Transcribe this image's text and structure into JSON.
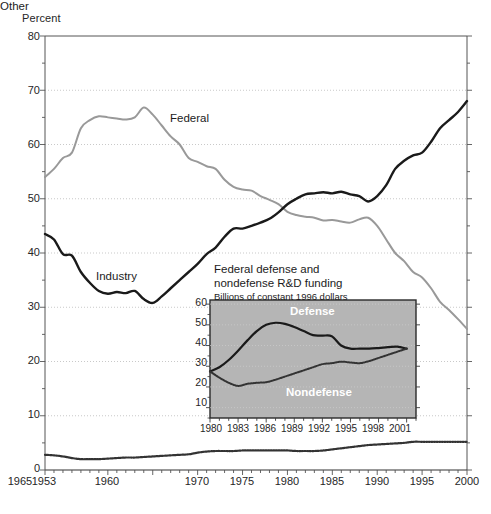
{
  "chart_data": [
    {
      "id": "main",
      "type": "line",
      "title": "",
      "ylabel": "Percent",
      "xlabel": "",
      "xlim": [
        1953,
        2000
      ],
      "ylim": [
        0,
        80
      ],
      "grid": true,
      "legend_position": "inline-annotations",
      "ytick_labels": [
        "80",
        "70",
        "60",
        "50",
        "40",
        "30",
        "20",
        "10",
        "0"
      ],
      "ytick_values": [
        80,
        70,
        60,
        50,
        40,
        30,
        20,
        10,
        0
      ],
      "yminor_step": 5,
      "xtick_labels": [
        "1953",
        "1960",
        "1965",
        "1970",
        "1975",
        "1980",
        "1985",
        "1990",
        "1995",
        "2000"
      ],
      "xtick_values": [
        1953,
        1960,
        1965,
        1970,
        1975,
        1980,
        1985,
        1990,
        1995,
        2000
      ],
      "x": [
        1953,
        1954,
        1955,
        1956,
        1957,
        1958,
        1959,
        1960,
        1961,
        1962,
        1963,
        1964,
        1965,
        1966,
        1967,
        1968,
        1969,
        1970,
        1971,
        1972,
        1973,
        1974,
        1975,
        1976,
        1977,
        1978,
        1979,
        1980,
        1981,
        1982,
        1983,
        1984,
        1985,
        1986,
        1987,
        1988,
        1989,
        1990,
        1991,
        1992,
        1993,
        1994,
        1995,
        1996,
        1997,
        1998,
        1999,
        2000
      ],
      "series": [
        {
          "name": "Federal",
          "color": "#999999",
          "style": "solid",
          "values": [
            54.0,
            55.5,
            57.5,
            58.5,
            63.0,
            64.5,
            65.2,
            65.0,
            64.8,
            64.6,
            65.0,
            66.8,
            65.5,
            63.5,
            61.5,
            60.0,
            57.5,
            56.8,
            56.0,
            55.5,
            53.5,
            52.2,
            51.7,
            51.5,
            50.5,
            49.8,
            49.0,
            47.6,
            47.0,
            46.7,
            46.5,
            46.0,
            46.1,
            45.8,
            45.6,
            46.2,
            46.5,
            45.0,
            42.5,
            40.0,
            38.5,
            36.5,
            35.5,
            33.5,
            31.0,
            29.5,
            27.8,
            26.0
          ]
        },
        {
          "name": "Industry",
          "color": "#1a1a1a",
          "style": "solid",
          "values": [
            43.5,
            42.5,
            39.8,
            39.5,
            36.5,
            34.5,
            33.0,
            32.5,
            32.8,
            32.6,
            33.0,
            31.5,
            30.8,
            32.0,
            33.5,
            35.0,
            36.5,
            38.0,
            39.8,
            41.0,
            43.0,
            44.5,
            44.5,
            45.0,
            45.6,
            46.3,
            47.5,
            49.0,
            50.0,
            50.8,
            51.0,
            51.2,
            51.0,
            51.3,
            50.8,
            50.5,
            49.5,
            50.5,
            52.5,
            55.5,
            57.0,
            58.0,
            58.5,
            60.5,
            63.0,
            64.5,
            66.0,
            68.0
          ]
        },
        {
          "name": "Other",
          "color": "#333333",
          "style": "dotted",
          "values": [
            2.8,
            2.7,
            2.5,
            2.2,
            2.0,
            2.0,
            2.0,
            2.1,
            2.2,
            2.3,
            2.3,
            2.4,
            2.5,
            2.6,
            2.7,
            2.8,
            2.9,
            3.2,
            3.4,
            3.5,
            3.5,
            3.5,
            3.6,
            3.6,
            3.6,
            3.6,
            3.6,
            3.6,
            3.5,
            3.5,
            3.5,
            3.6,
            3.8,
            4.0,
            4.2,
            4.4,
            4.6,
            4.7,
            4.8,
            4.9,
            5.0,
            5.2,
            5.2,
            5.2,
            5.2,
            5.2,
            5.2,
            5.2
          ]
        }
      ],
      "annotations": [
        {
          "text": "Federal",
          "x": 1968,
          "y": 63.5
        },
        {
          "text": "Industry",
          "x": 1961,
          "y": 35.0
        },
        {
          "text": "Other",
          "x": 1955,
          "y": 5.5
        }
      ]
    },
    {
      "id": "inset",
      "type": "line",
      "title": "Federal  defense and\nnondefense R&D funding",
      "title_line1": "Federal  defense and",
      "title_line2": "nondefense R&D funding",
      "subtitle": "Billions of constant 1996 dollars",
      "ylabel": "",
      "xlabel": "",
      "xlim": [
        1980,
        2002
      ],
      "ylim": [
        5,
        62
      ],
      "grid": true,
      "plot_background": "#b5b5b5",
      "legend_position": "inline-annotations",
      "ytick_labels": [
        "60",
        "50",
        "40",
        "30",
        "20",
        "10"
      ],
      "ytick_values": [
        60,
        50,
        40,
        30,
        20,
        10
      ],
      "xtick_labels": [
        "1980",
        "1983",
        "1986",
        "1989",
        "1992",
        "1995",
        "1998",
        "2001"
      ],
      "xtick_values": [
        1980,
        1983,
        1986,
        1989,
        1992,
        1995,
        1998,
        2001
      ],
      "x": [
        1980,
        1981,
        1982,
        1983,
        1984,
        1985,
        1986,
        1987,
        1988,
        1989,
        1990,
        1991,
        1992,
        1993,
        1994,
        1995,
        1996,
        1997,
        1998,
        1999,
        2000,
        2001
      ],
      "series": [
        {
          "name": "Defense",
          "color": "#1a1a1a",
          "style": "solid",
          "values": [
            27.5,
            29.5,
            33.0,
            37.5,
            42.5,
            47.0,
            50.0,
            51.0,
            50.5,
            49.0,
            47.0,
            45.0,
            44.8,
            44.5,
            40.0,
            38.5,
            38.5,
            38.5,
            38.8,
            39.2,
            39.5,
            38.5
          ]
        },
        {
          "name": "Nondefense",
          "color": "#333333",
          "style": "dotted",
          "values": [
            27.5,
            24.5,
            22.0,
            20.5,
            21.5,
            22.0,
            22.3,
            23.5,
            25.0,
            26.5,
            28.0,
            29.5,
            31.0,
            31.5,
            32.2,
            31.8,
            31.5,
            32.5,
            34.0,
            35.5,
            37.0,
            38.5
          ]
        }
      ],
      "annotations": [
        {
          "text": "Defense",
          "x": 1988.5,
          "y": 56.5
        },
        {
          "text": "Nondefense",
          "x": 1989.0,
          "y": 14.0
        }
      ]
    }
  ],
  "main_chart": {
    "ylabel": "Percent",
    "ytick_labels": [
      "80",
      "70",
      "60",
      "50",
      "40",
      "30",
      "20",
      "10",
      "0"
    ],
    "xtick_labels": [
      "1953",
      "1960",
      "1965",
      "1970",
      "1975",
      "1980",
      "1985",
      "1990",
      "1995",
      "2000"
    ],
    "labels": {
      "federal": "Federal",
      "industry": "Industry",
      "other": "Other"
    }
  },
  "inset_chart": {
    "title_line1": "Federal  defense and",
    "title_line2": "nondefense R&D funding",
    "subtitle": "Billions of constant 1996 dollars",
    "ytick_labels": [
      "60",
      "50",
      "40",
      "30",
      "20",
      "10"
    ],
    "xtick_labels": [
      "1980",
      "1983",
      "1986",
      "1989",
      "1992",
      "1995",
      "1998",
      "2001"
    ],
    "labels": {
      "defense": "Defense",
      "nondefense": "Nondefense"
    }
  },
  "colors": {
    "federal_line": "#999999",
    "industry_line": "#1a1a1a",
    "other_line": "#333333",
    "inset_background": "#b5b5b5",
    "axis": "#555555",
    "grid": "#bbbbbb",
    "text": "#1a1a1a"
  }
}
